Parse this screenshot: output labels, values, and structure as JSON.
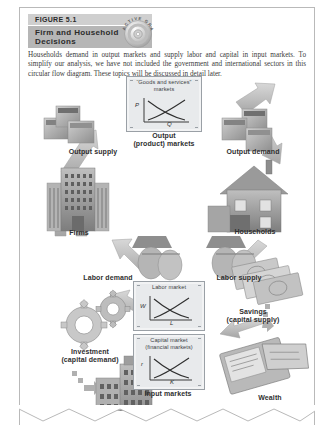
{
  "figure": {
    "number": "FIGURE 5.1",
    "title": "Firm and Household Decisions",
    "badge": "ACTIVE GRAPH",
    "badge_icon": "cd-disc-icon",
    "caption": "Households demand in output markets and supply labor and capital in input markets. To simplify our analysis, we have not included the government and international sectors in this circular flow diagram. These topics will be discussed in detail later."
  },
  "markets": {
    "output": {
      "title_line1": "“Goods and services”",
      "title_line2": "markets",
      "y_axis": "P",
      "x_axis": "Q",
      "caption_line1": "Output",
      "caption_line2": "(product) markets"
    },
    "labor": {
      "title_line1": "Labor market",
      "title_line2": "",
      "y_axis": "W",
      "x_axis": "L"
    },
    "capital": {
      "title_line1": "Capital market",
      "title_line2": "(financial markets)",
      "y_axis": "r",
      "x_axis": "K",
      "caption_line1": "Input markets",
      "caption_line2": ""
    }
  },
  "flow_labels": {
    "output_supply": "Output supply",
    "output_demand": "Output demand",
    "labor_demand": "Labor demand",
    "labor_supply": "Labor supply",
    "investment_line1": "Investment",
    "investment_line2": "(capital demand)",
    "savings_line1": "Savings",
    "savings_line2": "(capital supply)"
  },
  "actors": {
    "firms": "Firms",
    "households": "Households",
    "capital_stock": "Capital stock",
    "wealth": "Wealth"
  },
  "icons": {
    "firms": "office-building-icon",
    "households": "house-icon",
    "capital_stock": "high-rise-building-icon",
    "wealth": "bank-book-icon",
    "savings": "cash-money-icon",
    "investment": "gears-icon",
    "output_supply": "boxes-icon",
    "output_demand": "boxes-icon",
    "labor": "handshake-worker-icon"
  },
  "colors": {
    "header_light": "#cfcfcf",
    "header_dark": "#b6b6b6",
    "arrow": "#b7b7b7",
    "box_fill": "#e8eaec",
    "page_border": "#b9b9b9"
  }
}
